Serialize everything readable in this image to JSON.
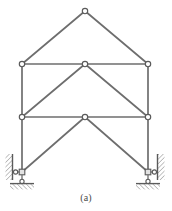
{
  "figure": {
    "caption": "(a)",
    "top_artifact_text": "▁▁  ▁▁▁  ▁▁  ▁▁▁▁  ▁▁",
    "colors": {
      "member": "#6e6e6e",
      "member_dark": "#555555",
      "node_fill": "#ffffff",
      "node_stroke": "#5a5a5a",
      "hatch": "#7a7a7a",
      "support_body": "#d8d8d8",
      "background": "#ffffff",
      "caption_text": "#4a4a4a"
    },
    "geometry": {
      "width": 172,
      "height": 211,
      "levels": {
        "apex_y": 11,
        "upper_chord_y": 64,
        "middle_chord_y": 117,
        "base_y": 172
      },
      "columns_x": {
        "left": 22,
        "center": 85,
        "right": 148
      }
    },
    "nodes": [
      {
        "id": "apex",
        "label": "apex-node",
        "x": 85,
        "y": 11
      },
      {
        "id": "upper-left",
        "label": "upper-left-node",
        "x": 22,
        "y": 64
      },
      {
        "id": "upper-center",
        "label": "upper-center-node",
        "x": 85,
        "y": 64
      },
      {
        "id": "upper-right",
        "label": "upper-right-node",
        "x": 148,
        "y": 64
      },
      {
        "id": "middle-left",
        "label": "middle-left-node",
        "x": 22,
        "y": 117
      },
      {
        "id": "middle-center",
        "label": "middle-center-node",
        "x": 85,
        "y": 117
      },
      {
        "id": "middle-right",
        "label": "middle-right-node",
        "x": 148,
        "y": 117
      },
      {
        "id": "base-left",
        "label": "base-left-node",
        "x": 22,
        "y": 172
      },
      {
        "id": "base-right",
        "label": "base-right-node",
        "x": 148,
        "y": 172
      }
    ],
    "members": [
      {
        "id": "rafter-left",
        "label": "left-roof-rafter",
        "from": [
          85,
          11
        ],
        "to": [
          22,
          64
        ]
      },
      {
        "id": "rafter-right",
        "label": "right-roof-rafter",
        "from": [
          85,
          11
        ],
        "to": [
          148,
          64
        ]
      },
      {
        "id": "upper-chord-left",
        "label": "upper-chord-left-span",
        "from": [
          22,
          64
        ],
        "to": [
          85,
          64
        ]
      },
      {
        "id": "upper-chord-right",
        "label": "upper-chord-right-span",
        "from": [
          85,
          64
        ],
        "to": [
          148,
          64
        ]
      },
      {
        "id": "mid-chord-left",
        "label": "middle-chord-left-span",
        "from": [
          22,
          117
        ],
        "to": [
          85,
          117
        ]
      },
      {
        "id": "mid-chord-right",
        "label": "middle-chord-right-span",
        "from": [
          85,
          117
        ],
        "to": [
          148,
          117
        ]
      },
      {
        "id": "column-left-upper",
        "label": "left-column-upper",
        "from": [
          22,
          64
        ],
        "to": [
          22,
          117
        ]
      },
      {
        "id": "column-right-upper",
        "label": "right-column-upper",
        "from": [
          148,
          64
        ],
        "to": [
          148,
          117
        ]
      },
      {
        "id": "column-left-lower",
        "label": "left-column-lower",
        "from": [
          22,
          117
        ],
        "to": [
          22,
          172
        ]
      },
      {
        "id": "column-right-lower",
        "label": "right-column-lower",
        "from": [
          148,
          117
        ],
        "to": [
          148,
          172
        ]
      },
      {
        "id": "diag-upper-left",
        "label": "upper-left-diagonal",
        "from": [
          22,
          117
        ],
        "to": [
          85,
          64
        ]
      },
      {
        "id": "diag-upper-right",
        "label": "upper-right-diagonal",
        "from": [
          148,
          117
        ],
        "to": [
          85,
          64
        ]
      },
      {
        "id": "diag-lower-left",
        "label": "lower-left-diagonal",
        "from": [
          22,
          172
        ],
        "to": [
          85,
          117
        ]
      },
      {
        "id": "diag-lower-right",
        "label": "lower-right-diagonal",
        "from": [
          148,
          172
        ],
        "to": [
          85,
          117
        ]
      }
    ],
    "supports": [
      {
        "id": "left-support",
        "label": "left-support-assembly",
        "side": "left",
        "horizontal_roller": {
          "wall_x": 11,
          "link_y": 172
        },
        "vertical_pin": {
          "node_x": 22,
          "ground_y": 186
        }
      },
      {
        "id": "right-support",
        "label": "right-support-assembly",
        "side": "right",
        "horizontal_roller": {
          "wall_x": 159,
          "link_y": 172
        },
        "vertical_pin": {
          "node_x": 148,
          "ground_y": 186
        }
      }
    ]
  }
}
